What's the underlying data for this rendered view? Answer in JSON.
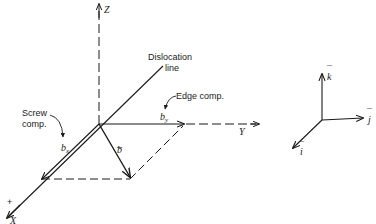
{
  "figure": {
    "main_axes": {
      "z_label": "Z",
      "y_label": "Y",
      "x_label": "X",
      "x_plus_sign": "+"
    },
    "annotations": {
      "dislocation_line_1": "Dislocation",
      "dislocation_line_2": "line",
      "edge_comp": "Edge comp.",
      "screw_comp_1": "Screw",
      "screw_comp_2": "comp."
    },
    "vectors": {
      "b": "b",
      "b_bar": "_",
      "bx": "b",
      "bx_sub": "x",
      "by": "b",
      "by_sub": "y"
    },
    "unit_vectors": {
      "k": "k",
      "j": "j",
      "i": "i",
      "bar": "¯"
    },
    "colors": {
      "ink": "#1a1a1a",
      "background": "#ffffff"
    }
  }
}
